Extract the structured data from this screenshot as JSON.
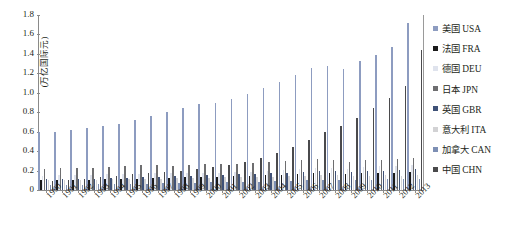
{
  "chart_data": {
    "type": "bar",
    "title": "",
    "subtitle": "",
    "xlabel": "",
    "ylabel": "(万亿国际元)",
    "ylim": [
      0,
      1.8
    ],
    "ytick_labels": [
      "1.8",
      "1.6",
      "1.4",
      "1.2",
      "1.0",
      "0.8",
      "0.6",
      "0.4",
      "0.2",
      "0"
    ],
    "ytick_values": [
      1.8,
      1.6,
      1.4,
      1.2,
      1.0,
      0.8,
      0.6,
      0.4,
      0.2,
      0
    ],
    "grid": false,
    "legend_position": "right",
    "categories": [
      "1990",
      "1991",
      "1992",
      "1993",
      "1994",
      "1995",
      "1996",
      "1997",
      "1998",
      "1999",
      "2000",
      "2001",
      "2002",
      "2003",
      "2004",
      "2005",
      "2006",
      "2007",
      "2008",
      "2009",
      "2010",
      "2011",
      "2012",
      "2013"
    ],
    "series": [
      {
        "name": "美国 USA",
        "color": "#8d9cc0",
        "values": [
          0.6,
          0.6,
          0.62,
          0.64,
          0.66,
          0.68,
          0.72,
          0.76,
          0.8,
          0.84,
          0.88,
          0.9,
          0.94,
          0.99,
          1.05,
          1.11,
          1.18,
          1.25,
          1.28,
          1.24,
          1.33,
          1.39,
          1.47,
          1.72
        ]
      },
      {
        "name": "法国 FRA",
        "color": "#1a1a1a",
        "values": [
          0.1,
          0.1,
          0.1,
          0.1,
          0.11,
          0.11,
          0.11,
          0.12,
          0.12,
          0.13,
          0.13,
          0.13,
          0.14,
          0.14,
          0.15,
          0.15,
          0.16,
          0.17,
          0.17,
          0.16,
          0.17,
          0.18,
          0.18,
          0.19
        ]
      },
      {
        "name": "德国 DEU",
        "color": "#dfe3ed",
        "values": [
          0.14,
          0.15,
          0.15,
          0.15,
          0.16,
          0.16,
          0.16,
          0.17,
          0.17,
          0.18,
          0.18,
          0.18,
          0.19,
          0.19,
          0.2,
          0.21,
          0.22,
          0.23,
          0.23,
          0.22,
          0.24,
          0.25,
          0.25,
          0.26
        ]
      },
      {
        "name": "日本 JPN",
        "color": "#6e6e70",
        "values": [
          0.22,
          0.23,
          0.23,
          0.23,
          0.24,
          0.25,
          0.26,
          0.26,
          0.25,
          0.26,
          0.27,
          0.27,
          0.27,
          0.28,
          0.29,
          0.3,
          0.31,
          0.32,
          0.31,
          0.29,
          0.31,
          0.31,
          0.32,
          0.33
        ]
      },
      {
        "name": "英国 GBR",
        "color": "#3f5177",
        "values": [
          0.11,
          0.11,
          0.11,
          0.11,
          0.12,
          0.12,
          0.13,
          0.13,
          0.14,
          0.14,
          0.15,
          0.15,
          0.16,
          0.16,
          0.17,
          0.18,
          0.19,
          0.2,
          0.2,
          0.19,
          0.2,
          0.2,
          0.21,
          0.22
        ]
      },
      {
        "name": "意大利 ITA",
        "color": "#d2d2d4",
        "values": [
          0.1,
          0.1,
          0.1,
          0.1,
          0.11,
          0.11,
          0.11,
          0.11,
          0.12,
          0.12,
          0.12,
          0.13,
          0.13,
          0.13,
          0.13,
          0.14,
          0.14,
          0.15,
          0.15,
          0.14,
          0.14,
          0.15,
          0.14,
          0.15
        ]
      },
      {
        "name": "加拿大 CAN",
        "color": "#7d8fb4",
        "values": [
          0.05,
          0.05,
          0.05,
          0.06,
          0.06,
          0.06,
          0.06,
          0.07,
          0.07,
          0.07,
          0.08,
          0.08,
          0.08,
          0.08,
          0.09,
          0.09,
          0.1,
          0.1,
          0.1,
          0.1,
          0.1,
          0.11,
          0.11,
          0.11
        ]
      },
      {
        "name": "中国 CHN",
        "color": "#4a4a4c",
        "values": [
          0.09,
          0.1,
          0.11,
          0.13,
          0.14,
          0.16,
          0.17,
          0.19,
          0.2,
          0.22,
          0.24,
          0.26,
          0.29,
          0.33,
          0.38,
          0.44,
          0.51,
          0.6,
          0.66,
          0.74,
          0.84,
          0.95,
          1.07,
          1.44
        ]
      }
    ]
  },
  "legend": {
    "items": [
      {
        "label": "美国 USA"
      },
      {
        "label": "法国 FRA"
      },
      {
        "label": "德国 DEU"
      },
      {
        "label": "日本 JPN"
      },
      {
        "label": "英国 GBR"
      },
      {
        "label": "意大利 ITA"
      },
      {
        "label": "加拿大 CAN"
      },
      {
        "label": "中国 CHN"
      }
    ]
  }
}
